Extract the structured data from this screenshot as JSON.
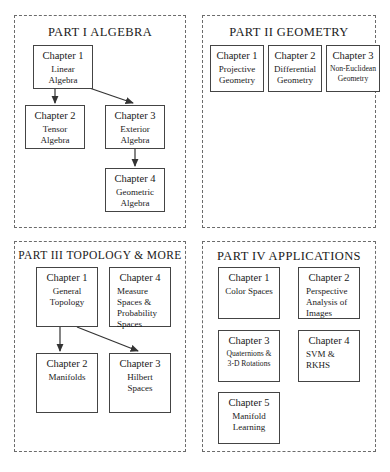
{
  "diagram": {
    "panels": [
      {
        "id": "part-1",
        "title": "PART I  ALGEBRA",
        "boxes": [
          {
            "id": "p1c1",
            "chapter": "Chapter 1",
            "body": "Linear\nAlgebra",
            "align": "center"
          },
          {
            "id": "p1c2",
            "chapter": "Chapter 2",
            "body": "Tensor\nAlgebra",
            "align": "center"
          },
          {
            "id": "p1c3",
            "chapter": "Chapter 3",
            "body": "Exterior\nAlgebra",
            "align": "center"
          },
          {
            "id": "p1c4",
            "chapter": "Chapter 4",
            "body": "Geometric\nAlgebra",
            "align": "center"
          }
        ],
        "arrows": [
          {
            "from": "p1c1",
            "to": "p1c2"
          },
          {
            "from": "p1c1",
            "to": "p1c3"
          },
          {
            "from": "p1c3",
            "to": "p1c4"
          }
        ]
      },
      {
        "id": "part-2",
        "title": "PART II  GEOMETRY",
        "boxes": [
          {
            "id": "p2c1",
            "chapter": "Chapter 1",
            "body": "Projective\nGeometry",
            "align": "center"
          },
          {
            "id": "p2c2",
            "chapter": "Chapter 2",
            "body": "Differential\nGeometry",
            "align": "center"
          },
          {
            "id": "p2c3",
            "chapter": "Chapter 3",
            "body": "Non-Euclidean\nGeometry",
            "align": "center",
            "size": "tiny-first"
          }
        ],
        "arrows": []
      },
      {
        "id": "part-3",
        "title": "PART III  TOPOLOGY & MORE",
        "boxes": [
          {
            "id": "p3c1",
            "chapter": "Chapter 1",
            "body": "General\nTopology",
            "align": "center"
          },
          {
            "id": "p3c4",
            "chapter": "Chapter 4",
            "body": "Measure\nSpaces &\nProbability\nSpaces",
            "align": "left"
          },
          {
            "id": "p3c2",
            "chapter": "Chapter 2",
            "body": "Manifolds",
            "align": "center"
          },
          {
            "id": "p3c3",
            "chapter": "Chapter 3",
            "body": "Hilbert\nSpaces",
            "align": "center"
          }
        ],
        "arrows": [
          {
            "from": "p3c1",
            "to": "p3c2"
          },
          {
            "from": "p3c1",
            "to": "p3c3"
          }
        ]
      },
      {
        "id": "part-4",
        "title": "PART IV  APPLICATIONS",
        "boxes": [
          {
            "id": "p4c1",
            "chapter": "Chapter 1",
            "body": "Color Spaces",
            "align": "center"
          },
          {
            "id": "p4c2",
            "chapter": "Chapter 2",
            "body": "Perspective\nAnalysis of\nImages",
            "align": "left"
          },
          {
            "id": "p4c3",
            "chapter": "Chapter 3",
            "body": "Quaternions &\n3-D Rotations",
            "align": "center"
          },
          {
            "id": "p4c4",
            "chapter": "Chapter 4",
            "body": "SVM &\nRKHS",
            "align": "left"
          },
          {
            "id": "p4c5",
            "chapter": "Chapter 5",
            "body": "Manifold\nLearning",
            "align": "center"
          }
        ],
        "arrows": []
      }
    ]
  },
  "colors": {
    "panel_border": "#6b6b6b",
    "box_border": "#444444",
    "text": "#1a1a1a",
    "background": "#ffffff"
  }
}
